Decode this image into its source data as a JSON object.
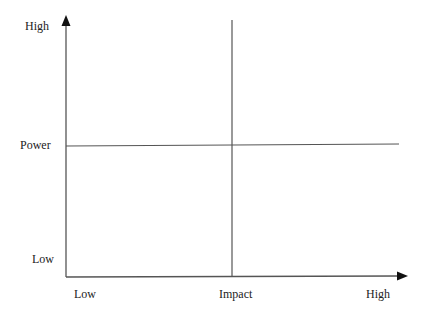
{
  "diagram": {
    "type": "power-impact matrix",
    "y_axis": {
      "title": "Power",
      "high_label": "High",
      "low_label": "Low"
    },
    "x_axis": {
      "title": "Impact",
      "low_label": "Low",
      "high_label": "High"
    },
    "colors": {
      "line": "#555555",
      "arrow": "#111111",
      "text": "#222222"
    }
  }
}
